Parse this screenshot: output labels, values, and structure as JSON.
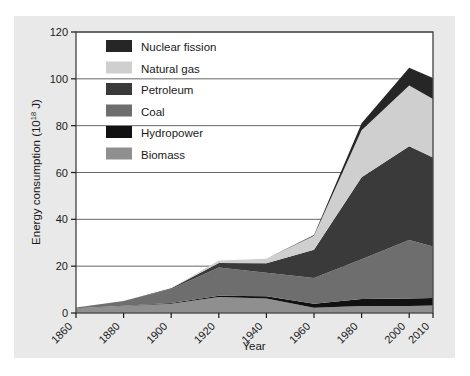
{
  "figure": {
    "background_color": "#e9e9e9",
    "plot_background_color": "#ffffff",
    "frame_color": "#4d4d4d"
  },
  "chart_data": {
    "type": "area",
    "stacked": true,
    "title": "",
    "xlabel": "Year",
    "ylabel": "Energy consumption (10^18 J)",
    "ylabel_main": "Energy consumption (10",
    "ylabel_sup": "18",
    "ylabel_tail": " J)",
    "x": [
      1860,
      1880,
      1900,
      1920,
      1940,
      1960,
      1980,
      2000,
      2010
    ],
    "categories": [
      "1860",
      "1880",
      "1900",
      "1920",
      "1940",
      "1960",
      "1980",
      "2000",
      "2010"
    ],
    "xtick_labels": [
      "1860",
      "1880",
      "1900",
      "1920",
      "1940",
      "1960",
      "1980",
      "2000",
      "2010"
    ],
    "ytick_labels": [
      "0",
      "20",
      "40",
      "60",
      "80",
      "100",
      "120"
    ],
    "ytick_values": [
      0,
      20,
      40,
      60,
      80,
      100,
      120
    ],
    "ylim": [
      0,
      120
    ],
    "grid": "horizontal",
    "legend_position": "upper-left-inside",
    "stack_order_bottom_to_top": [
      "Biomass",
      "Hydropower",
      "Coal",
      "Petroleum",
      "Natural gas",
      "Nuclear fission"
    ],
    "series": [
      {
        "name": "Nuclear fission",
        "color": "#262626",
        "legend_index": 0,
        "values": [
          0,
          0,
          0,
          0,
          0,
          0.3,
          3.0,
          7.5,
          9.0
        ]
      },
      {
        "name": "Natural gas",
        "color": "#cfcfcf",
        "legend_index": 1,
        "values": [
          0,
          0,
          0,
          1.0,
          2.0,
          6.0,
          20.0,
          26.0,
          25.0
        ]
      },
      {
        "name": "Petroleum",
        "color": "#3a3a3a",
        "legend_index": 2,
        "values": [
          0,
          0,
          0.3,
          2.0,
          4.0,
          12.0,
          35.0,
          40.0,
          38.0
        ]
      },
      {
        "name": "Coal",
        "color": "#6e6e6e",
        "legend_index": 3,
        "values": [
          0.3,
          2.0,
          6.0,
          12.0,
          10.0,
          11.0,
          17.0,
          25.0,
          22.0
        ]
      },
      {
        "name": "Hydropower",
        "color": "#111111",
        "legend_index": 4,
        "values": [
          0,
          0.1,
          0.3,
          0.6,
          1.0,
          1.8,
          3.0,
          3.2,
          3.2
        ]
      },
      {
        "name": "Biomass",
        "color": "#8f8f8f",
        "legend_index": 5,
        "values": [
          2.0,
          3.0,
          4.0,
          6.8,
          6.2,
          2.2,
          3.0,
          3.0,
          3.2
        ]
      }
    ],
    "totals": [
      2.3,
      5.1,
      10.6,
      22.4,
      23.2,
      33.3,
      81.0,
      104.7,
      100.4
    ]
  },
  "legend": {
    "items": [
      {
        "label": "Nuclear fission",
        "color": "#262626"
      },
      {
        "label": "Natural gas",
        "color": "#cfcfcf"
      },
      {
        "label": "Petroleum",
        "color": "#3a3a3a"
      },
      {
        "label": "Coal",
        "color": "#6e6e6e"
      },
      {
        "label": "Hydropower",
        "color": "#111111"
      },
      {
        "label": "Biomass",
        "color": "#8f8f8f"
      }
    ]
  }
}
